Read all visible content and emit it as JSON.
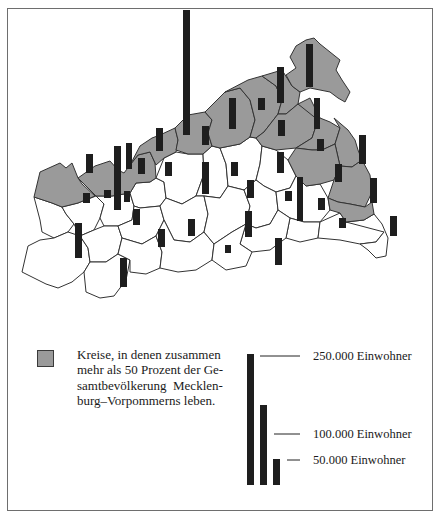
{
  "map": {
    "title": "",
    "region": "Mecklenburg-Vorpommern",
    "colors": {
      "highlight_fill": "#9a9a9a",
      "district_fill": "#ffffff",
      "border": "#333333",
      "bar": "#1e1e1e",
      "frame": "#6e6e6e"
    },
    "highlighted_districts": [
      {
        "name": "north-west-1",
        "points": "34,197 40,172 60,163 66,168 72,163 78,178 82,184 95,196 78,203 62,207 52,203 43,200"
      },
      {
        "name": "north-west-2",
        "points": "78,178 95,166 110,161 118,170 124,173 130,165 138,155 150,152 155,163 156,178 150,182 136,183 130,193 112,196 96,196"
      },
      {
        "name": "north-3",
        "points": "130,165 140,146 152,138 160,135 175,128 178,140 176,152 164,158 156,165 150,152 138,155"
      },
      {
        "name": "rostock-land",
        "points": "175,128 188,115 205,112 212,120 208,133 212,146 203,154 188,154 176,150 178,140"
      },
      {
        "name": "bad-doberan-east",
        "points": "205,112 225,92 240,88 250,100 255,120 250,137 240,144 220,148 212,146 208,133 212,120"
      },
      {
        "name": "ribnitz",
        "points": "225,92 248,80 262,76 276,86 282,100 278,114 264,132 256,138 250,137 255,120 250,100 240,88"
      },
      {
        "name": "stralsund-land",
        "points": "262,76 282,70 292,86 300,92 298,104 286,114 278,114 282,100 276,86"
      },
      {
        "name": "ruegen",
        "points": "290,57 296,46 306,40 314,38 320,44 330,52 340,60 336,70 342,80 350,92 345,102 338,98 330,92 320,90 310,88 300,92 292,86 286,75 296,68"
      },
      {
        "name": "grimmen",
        "points": "264,132 278,114 286,114 298,104 310,110 318,120 312,138 296,148 276,150 262,146 256,138"
      },
      {
        "name": "greifswald",
        "points": "298,104 310,98 320,118 330,122 340,128 335,144 322,150 312,150 296,148 312,138 318,120"
      },
      {
        "name": "wolgast",
        "points": "334,118 348,130 355,140 358,150 362,160 352,167 340,166 335,144 340,128"
      },
      {
        "name": "anklam",
        "points": "296,148 312,150 322,150 335,144 340,166 334,180 320,184 306,186 296,176 288,160"
      },
      {
        "name": "ueckermuende",
        "points": "334,180 340,166 352,167 362,160 370,175 372,192 365,207 350,204 338,202 328,198"
      },
      {
        "name": "pasewalk",
        "points": "328,198 338,202 350,204 365,207 372,202 374,214 364,220 346,222 340,213 330,210"
      }
    ],
    "white_districts": [
      {
        "name": "hagenow-north",
        "points": "34,197 43,200 52,203 62,207 66,214 74,224 68,232 54,238 42,232 40,220"
      },
      {
        "name": "hagenow",
        "points": "62,207 78,203 96,196 104,204 100,218 94,230 80,236 74,224 66,214"
      },
      {
        "name": "schwerin-land",
        "points": "96,196 112,196 130,193 134,206 132,220 118,226 104,226 100,218 104,204"
      },
      {
        "name": "sternberg",
        "points": "130,193 136,183 150,182 156,178 164,182 166,198 160,206 140,208 134,206"
      },
      {
        "name": "guestrow",
        "points": "156,178 164,158 176,152 188,154 203,154 204,174 196,196 182,204 166,198 164,182"
      },
      {
        "name": "teterow",
        "points": "203,154 212,146 220,148 226,164 228,186 220,198 204,196 196,196 204,174"
      },
      {
        "name": "malchin",
        "points": "220,148 240,144 250,137 256,138 262,146 260,164 256,180 244,190 228,186 226,164"
      },
      {
        "name": "demmin",
        "points": "262,146 276,150 288,160 296,176 290,188 276,192 264,186 256,180 260,164"
      },
      {
        "name": "ludwigslust",
        "points": "22,272 28,246 40,240 54,238 68,232 80,236 88,248 90,262 84,272 72,282 58,288 46,284"
      },
      {
        "name": "parchim",
        "points": "80,236 94,230 104,226 118,226 122,238 118,254 106,262 90,262 88,248"
      },
      {
        "name": "luebz",
        "points": "118,226 132,220 134,206 140,208 160,206 164,220 156,236 142,244 122,238"
      },
      {
        "name": "waren",
        "points": "160,206 166,198 182,204 196,196 204,196 208,214 204,232 190,242 174,240 164,220"
      },
      {
        "name": "roebel",
        "points": "84,272 90,262 106,262 118,254 130,260 126,280 114,296 100,298 86,292"
      },
      {
        "name": "mueritz",
        "points": "118,254 122,238 142,244 156,236 162,252 160,268 146,274 130,272 130,260"
      },
      {
        "name": "neustrelitz",
        "points": "156,236 164,220 174,240 190,242 204,232 214,244 212,260 196,270 178,272 160,268 162,252"
      },
      {
        "name": "neubrandenburg-land",
        "points": "204,196 220,198 228,186 244,190 250,206 246,224 232,232 214,244 204,232 208,214"
      },
      {
        "name": "altentreptow",
        "points": "244,190 256,180 264,186 276,192 278,210 270,224 256,228 246,224 250,206"
      },
      {
        "name": "friedland",
        "points": "276,192 290,188 296,176 306,186 320,184 328,198 330,210 320,222 304,222 290,218 278,210"
      },
      {
        "name": "strasburg",
        "points": "290,218 304,222 320,222 318,238 300,242 286,238"
      },
      {
        "name": "prenzlau-area",
        "points": "246,224 256,228 270,224 278,210 290,218 286,238 270,250 252,252 240,244"
      },
      {
        "name": "templin",
        "points": "214,244 232,232 246,224 240,244 252,252 246,266 226,270 212,260"
      },
      {
        "name": "ueckermuende-south",
        "points": "320,222 340,213 346,222 364,220 374,214 384,232 376,242 360,244 340,240 318,238"
      },
      {
        "name": "pasewalk-south",
        "points": "346,222 364,220 374,214 382,224 388,238 386,256 376,258 368,250 360,244 376,242 384,232"
      }
    ],
    "city_bars": [
      {
        "name": "rostock",
        "x": 183,
        "y": 10,
        "w": 7,
        "h": 125
      },
      {
        "name": "schwerin",
        "x": 114,
        "y": 146,
        "w": 7,
        "h": 64
      },
      {
        "name": "wismar",
        "x": 126,
        "y": 143,
        "w": 6,
        "h": 26
      },
      {
        "name": "neubrandenburg",
        "x": 297,
        "y": 177,
        "w": 6,
        "h": 44
      },
      {
        "name": "stralsund",
        "x": 277,
        "y": 67,
        "w": 7,
        "h": 36
      },
      {
        "name": "greifswald",
        "x": 314,
        "y": 98,
        "w": 6,
        "h": 31
      },
      {
        "name": "ruegen",
        "x": 306,
        "y": 44,
        "w": 7,
        "h": 43
      },
      {
        "name": "nordwestmecklenburg",
        "x": 86,
        "y": 154,
        "w": 7,
        "h": 19
      },
      {
        "name": "grevesmuehlen-area",
        "x": 138,
        "y": 158,
        "w": 7,
        "h": 16
      },
      {
        "name": "bad-doberan",
        "x": 156,
        "y": 128,
        "w": 7,
        "h": 23
      },
      {
        "name": "rostock-land",
        "x": 202,
        "y": 126,
        "w": 7,
        "h": 19
      },
      {
        "name": "ribnitz",
        "x": 229,
        "y": 98,
        "w": 7,
        "h": 31
      },
      {
        "name": "stralsund-land",
        "x": 258,
        "y": 98,
        "w": 7,
        "h": 12
      },
      {
        "name": "grimmen",
        "x": 278,
        "y": 120,
        "w": 7,
        "h": 16
      },
      {
        "name": "greifswald-land",
        "x": 317,
        "y": 139,
        "w": 7,
        "h": 12
      },
      {
        "name": "wolgast",
        "x": 359,
        "y": 135,
        "w": 7,
        "h": 29
      },
      {
        "name": "anklam",
        "x": 335,
        "y": 164,
        "w": 7,
        "h": 18
      },
      {
        "name": "ueckermuende",
        "x": 370,
        "y": 178,
        "w": 7,
        "h": 25
      },
      {
        "name": "pasewalk",
        "x": 370,
        "y": 185,
        "w": 7,
        "h": 1
      },
      {
        "name": "hagenow-north",
        "x": 83,
        "y": 193,
        "w": 7,
        "h": 10
      },
      {
        "name": "luebz-area",
        "x": 104,
        "y": 190,
        "w": 7,
        "h": 8
      },
      {
        "name": "schwerin-land",
        "x": 124,
        "y": 191,
        "w": 6,
        "h": 11
      },
      {
        "name": "sternberg",
        "x": 165,
        "y": 162,
        "w": 7,
        "h": 14
      },
      {
        "name": "guestrow",
        "x": 202,
        "y": 162,
        "w": 7,
        "h": 32
      },
      {
        "name": "teterow",
        "x": 231,
        "y": 162,
        "w": 7,
        "h": 14
      },
      {
        "name": "malchin",
        "x": 277,
        "y": 152,
        "w": 7,
        "h": 21
      },
      {
        "name": "demmin-west",
        "x": 247,
        "y": 180,
        "w": 7,
        "h": 18
      },
      {
        "name": "altentreptow",
        "x": 285,
        "y": 191,
        "w": 7,
        "h": 10
      },
      {
        "name": "friedland",
        "x": 318,
        "y": 198,
        "w": 7,
        "h": 12
      },
      {
        "name": "strasburg",
        "x": 339,
        "y": 218,
        "w": 7,
        "h": 10
      },
      {
        "name": "prenzlau",
        "x": 390,
        "y": 216,
        "w": 7,
        "h": 20
      },
      {
        "name": "parchim",
        "x": 133,
        "y": 209,
        "w": 7,
        "h": 16
      },
      {
        "name": "ludwigslust",
        "x": 75,
        "y": 223,
        "w": 7,
        "h": 35
      },
      {
        "name": "luebz",
        "x": 158,
        "y": 229,
        "w": 7,
        "h": 18
      },
      {
        "name": "waren",
        "x": 188,
        "y": 219,
        "w": 7,
        "h": 17
      },
      {
        "name": "roebel",
        "x": 120,
        "y": 258,
        "w": 7,
        "h": 29
      },
      {
        "name": "mueritz",
        "x": 225,
        "y": 245,
        "w": 6,
        "h": 8
      },
      {
        "name": "neustrelitz",
        "x": 275,
        "y": 238,
        "w": 7,
        "h": 27
      },
      {
        "name": "templin",
        "x": 245,
        "y": 211,
        "w": 7,
        "h": 26
      }
    ]
  },
  "legend": {
    "highlight_lines": [
      "Kreise, in denen zusammen",
      "mehr als 50 Prozent der Ge-",
      "samtbevölkerung  Mecklen-",
      "burg–Vorpommerns leben."
    ],
    "scale": [
      {
        "label": "250.000 Einwohner",
        "value": 250000,
        "bar_x": 247,
        "bar_top": 354,
        "line_x1": 260,
        "line_x2": 300,
        "line_y": 356,
        "label_x": 313,
        "label_y": 349
      },
      {
        "label": "100.000 Einwohner",
        "value": 100000,
        "bar_x": 260,
        "bar_top": 405,
        "line_x1": 274,
        "line_x2": 300,
        "line_y": 434,
        "label_x": 313,
        "label_y": 427
      },
      {
        "label": "50.000 Einwohner",
        "value": 50000,
        "bar_x": 273,
        "bar_top": 459,
        "line_x1": 287,
        "line_x2": 300,
        "line_y": 460,
        "label_x": 313,
        "label_y": 453
      }
    ],
    "scale_bar_bottom": 485,
    "scale_bar_width": 7
  }
}
